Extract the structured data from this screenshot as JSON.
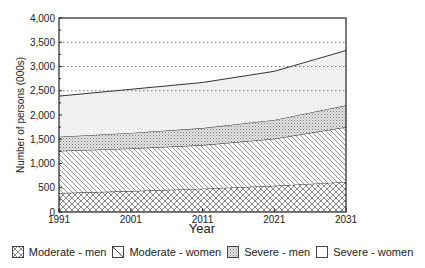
{
  "chart_data": {
    "type": "area",
    "stacked": true,
    "title": "",
    "xlabel": "Year",
    "ylabel": "Number of persons (000s)",
    "x": [
      1991,
      2001,
      2011,
      2021,
      2031
    ],
    "x_tick_labels": [
      "1991",
      "2001",
      "2011",
      "2021",
      "2031"
    ],
    "ylim": [
      0,
      4000
    ],
    "y_ticks": [
      0,
      500,
      1000,
      1500,
      2000,
      2500,
      3000,
      3500,
      4000
    ],
    "y_tick_labels": [
      "0",
      "500",
      "1,000",
      "1,500",
      "2,000",
      "2,500",
      "3,000",
      "3,500",
      "4,000"
    ],
    "gridlines": {
      "style": "dotted",
      "values": [
        2500,
        3000,
        3500
      ]
    },
    "legend_position": "bottom",
    "series": [
      {
        "name": "Moderate - men",
        "pattern": "crosshatch",
        "values": [
          390,
          430,
          480,
          540,
          620
        ]
      },
      {
        "name": "Moderate - women",
        "pattern": "diagonal",
        "values": [
          870,
          880,
          900,
          970,
          1130
        ]
      },
      {
        "name": "Severe - men",
        "pattern": "dense-dots",
        "values": [
          290,
          320,
          350,
          390,
          450
        ]
      },
      {
        "name": "Severe - women",
        "pattern": "sparse-dots",
        "values": [
          840,
          900,
          940,
          1000,
          1130
        ]
      }
    ],
    "cumulative_totals": [
      2390,
      2530,
      2670,
      2900,
      3330
    ]
  },
  "legend": {
    "items": [
      {
        "label": "Moderate - men",
        "icon": "crosshatch-swatch"
      },
      {
        "label": "Moderate - women",
        "icon": "diagonal-swatch"
      },
      {
        "label": "Severe - men",
        "icon": "dense-dots-swatch"
      },
      {
        "label": "Severe - women",
        "icon": "sparse-dots-swatch"
      }
    ]
  },
  "axis": {
    "x_title": "Year",
    "y_title": "Number of persons (000s)"
  }
}
